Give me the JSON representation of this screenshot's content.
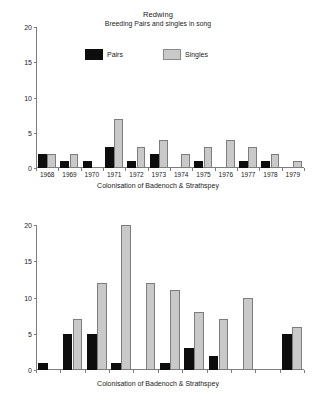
{
  "chart_data": [
    {
      "id": "top",
      "type": "bar",
      "title": "Redwing",
      "subtitle": "Breeding Pairs and singles in song",
      "xlabel": "Colonisation of Badenoch & Strathspey",
      "ylabel": "",
      "ylim": [
        0,
        20
      ],
      "yticks": [
        0,
        5,
        10,
        15,
        20
      ],
      "grid": false,
      "legend_position": "top-center",
      "categories": [
        "1968",
        "1969",
        "1970",
        "1971",
        "1972",
        "1973",
        "1974",
        "1975",
        "1976",
        "1977",
        "1978",
        "1979"
      ],
      "series": [
        {
          "name": "Pairs",
          "color": "#0d0d0d",
          "values": [
            2,
            1,
            1,
            3,
            1,
            2,
            0,
            1,
            0,
            1,
            1,
            0
          ]
        },
        {
          "name": "Singles",
          "color": "#c9c9c9",
          "values": [
            2,
            2,
            0,
            7,
            3,
            4,
            2,
            3,
            4,
            3,
            2,
            1
          ]
        }
      ]
    },
    {
      "id": "bottom",
      "type": "bar",
      "title": "",
      "subtitle": "",
      "xlabel": "Colonisation of Badenoch & Strathspey",
      "ylabel": "",
      "ylim": [
        0,
        20
      ],
      "yticks": [
        0,
        5,
        10,
        15,
        20
      ],
      "grid": false,
      "legend_position": "none",
      "categories": [
        "1980",
        "1981",
        "1982",
        "1983",
        "1984",
        "1985",
        "1986",
        "1987",
        "1988",
        "1989",
        "1990"
      ],
      "series": [
        {
          "name": "Pairs",
          "color": "#0d0d0d",
          "values": [
            1,
            5,
            5,
            1,
            0,
            1,
            3,
            2,
            0,
            0,
            5
          ]
        },
        {
          "name": "Singles",
          "color": "#c9c9c9",
          "values": [
            0,
            7,
            12,
            20,
            12,
            11,
            8,
            7,
            10,
            0,
            6
          ]
        }
      ]
    }
  ],
  "legend": {
    "pairs_label": "Pairs",
    "singles_label": "Singles"
  },
  "colors": {
    "pairs": "#0d0d0d",
    "singles": "#c9c9c9",
    "axis": "#7d7d7d",
    "background": "#ffffff",
    "text": "#1a1a1a"
  }
}
